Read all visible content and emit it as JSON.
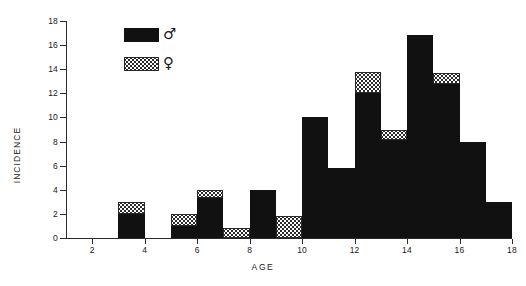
{
  "chart_data": {
    "type": "bar",
    "title": "",
    "subtitle": "",
    "xlabel": "AGE",
    "ylabel": "INCIDENCE",
    "xlim": [
      1,
      18
    ],
    "ylim": [
      0,
      18
    ],
    "xticks": [
      2,
      4,
      6,
      8,
      10,
      12,
      14,
      16,
      18
    ],
    "yticks": [
      0,
      2,
      4,
      6,
      8,
      10,
      12,
      14,
      16,
      18
    ],
    "grid": false,
    "stacked": true,
    "bin_width": 1,
    "legend_position": "top-left",
    "legend": [
      {
        "name": "Male",
        "symbol": "♂",
        "pattern": "solid-black",
        "color": "#111111"
      },
      {
        "name": "Female",
        "symbol": "♀",
        "pattern": "checkered",
        "color": "#2b2b2b"
      }
    ],
    "categories": [
      "3-4",
      "4-5",
      "5-6",
      "6-7",
      "7-8",
      "8-9",
      "9-10",
      "10-11",
      "11-12",
      "12-13",
      "13-14",
      "14-15",
      "15-16",
      "16-17",
      "17-18"
    ],
    "bin_starts": [
      3,
      4,
      5,
      6,
      7,
      8,
      9,
      10,
      11,
      12,
      13,
      14,
      15,
      16,
      17
    ],
    "series": [
      {
        "name": "Male",
        "values": [
          2,
          0,
          1,
          3.3,
          0,
          4,
          0,
          10,
          5.8,
          12,
          8.1,
          16.8,
          12.8,
          8,
          3
        ]
      },
      {
        "name": "Female",
        "values": [
          1,
          0,
          1,
          0.7,
          0.8,
          0,
          1.8,
          0,
          0,
          1.8,
          0.9,
          0,
          0.9,
          0,
          0
        ]
      }
    ],
    "totals": [
      3,
      0,
      2,
      4,
      0.8,
      4,
      1.8,
      10,
      5.8,
      13.8,
      9,
      16.8,
      13.7,
      8,
      3
    ]
  }
}
